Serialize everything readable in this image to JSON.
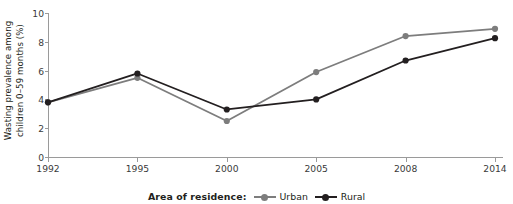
{
  "chart_data": {
    "type": "line",
    "title": "",
    "xlabel": "",
    "ylabel": "Wasting prevalence among children 0–59 months (%)",
    "ylabel_line1": "Wasting prevalence among",
    "ylabel_line2": "children 0–59 months (%)",
    "categories": [
      "1992",
      "1995",
      "2000",
      "2005",
      "2008",
      "2014"
    ],
    "x_tick_labels": [
      "1992",
      "1995",
      "2000",
      "2005",
      "2008",
      "2014"
    ],
    "y_tick_labels": [
      "0",
      "2",
      "4",
      "6",
      "8",
      "10"
    ],
    "y_ticks": [
      0,
      2,
      4,
      6,
      8,
      10
    ],
    "ylim": [
      0,
      10
    ],
    "grid": false,
    "legend_position": "bottom-center",
    "legend_title": "Area of residence:",
    "series": [
      {
        "name": "Urban",
        "color": "#7d7d7d",
        "values": [
          3.8,
          5.5,
          2.5,
          5.9,
          8.4,
          8.9
        ]
      },
      {
        "name": "Rural",
        "color": "#231f20",
        "values": [
          3.8,
          5.8,
          3.3,
          4.0,
          6.7,
          8.25
        ]
      }
    ]
  },
  "colors": {
    "urban": "#7d7d7d",
    "rural": "#231f20",
    "axis": "#9a9a9a",
    "text": "#231f20",
    "background": "#ffffff"
  }
}
